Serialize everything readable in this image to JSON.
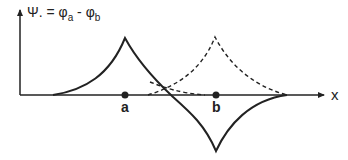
{
  "title": {
    "lhs": "Ψ.",
    "eq": " = ",
    "phi_a": "φ",
    "sub_a": "a",
    "minus": " - ",
    "phi_b": "φ",
    "sub_b": "b"
  },
  "axes": {
    "x_label": "x"
  },
  "points": [
    {
      "label": "a"
    },
    {
      "label": "b"
    }
  ],
  "colors": {
    "line": "#222222",
    "background": "#ffffff"
  }
}
